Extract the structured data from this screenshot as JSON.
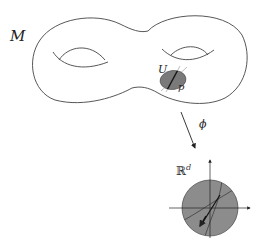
{
  "figure": {
    "manifold_label": "M",
    "patch_label": "U",
    "point_label": "p",
    "map_label": "ϕ",
    "target_label_base": "ℝ",
    "target_label_sup": "d",
    "colors": {
      "stroke": "#333333",
      "patch_fill": "#7a7a7a",
      "disc_fill": "#8c8c8c",
      "background": "#ffffff"
    }
  }
}
